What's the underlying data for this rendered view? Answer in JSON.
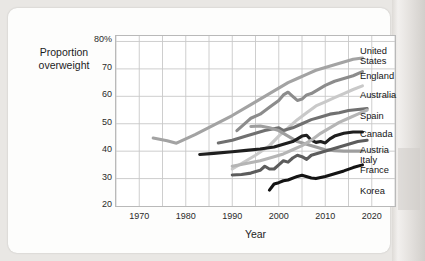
{
  "axes": {
    "y_label_line1": "Proportion",
    "y_label_line2": "overweight",
    "x_label": "Year",
    "y_ticks": [
      "80%",
      "70",
      "60",
      "50",
      "40",
      "30",
      "20"
    ],
    "x_ticks": [
      "1970",
      "1980",
      "1990",
      "2000",
      "2010",
      "2020"
    ]
  },
  "legend": {
    "items": [
      {
        "label_line1": "United",
        "label_line2": "States"
      },
      {
        "label_line1": "England",
        "label_line2": ""
      },
      {
        "label_line1": "Australia",
        "label_line2": ""
      },
      {
        "label_line1": "Spain",
        "label_line2": ""
      },
      {
        "label_line1": "Canada",
        "label_line2": ""
      },
      {
        "label_line1": "Austria",
        "label_line2": ""
      },
      {
        "label_line1": "Italy",
        "label_line2": ""
      },
      {
        "label_line1": "France",
        "label_line2": ""
      },
      {
        "label_line1": "Korea",
        "label_line2": ""
      }
    ]
  },
  "chart_data": {
    "type": "line",
    "title": "",
    "xlabel": "Year",
    "ylabel": "Proportion overweight",
    "xlim": [
      1965,
      2025
    ],
    "ylim": [
      20,
      82
    ],
    "y_unit": "%",
    "grid": true,
    "grid_x_step": 5,
    "grid_y_step": 10,
    "legend_position": "right",
    "series": [
      {
        "name": "United States",
        "color": "#a3a3a3",
        "points": [
          [
            1973,
            44.8
          ],
          [
            1976,
            43.8
          ],
          [
            1978,
            42.9
          ],
          [
            1982,
            46.0
          ],
          [
            1986,
            49.5
          ],
          [
            1990,
            53.0
          ],
          [
            1994,
            57.0
          ],
          [
            1998,
            61.0
          ],
          [
            2000,
            63.0
          ],
          [
            2002,
            65.0
          ],
          [
            2004,
            66.5
          ],
          [
            2006,
            68.0
          ],
          [
            2008,
            69.5
          ],
          [
            2010,
            70.5
          ],
          [
            2012,
            71.5
          ],
          [
            2014,
            72.5
          ],
          [
            2016,
            73.5
          ],
          [
            2018,
            74.0
          ]
        ]
      },
      {
        "name": "England",
        "color": "#8c8c8c",
        "points": [
          [
            1991,
            47.5
          ],
          [
            1993,
            50.5
          ],
          [
            1994,
            52.0
          ],
          [
            1996,
            53.5
          ],
          [
            1998,
            56.0
          ],
          [
            2000,
            58.5
          ],
          [
            2001,
            60.5
          ],
          [
            2002,
            61.5
          ],
          [
            2003,
            60.0
          ],
          [
            2004,
            58.5
          ],
          [
            2005,
            59.0
          ],
          [
            2006,
            60.5
          ],
          [
            2007,
            61.0
          ],
          [
            2008,
            62.0
          ],
          [
            2009,
            63.0
          ],
          [
            2010,
            64.0
          ],
          [
            2012,
            65.5
          ],
          [
            2014,
            66.5
          ],
          [
            2016,
            67.5
          ],
          [
            2018,
            69.0
          ]
        ]
      },
      {
        "name": "Australia",
        "color": "#c9c9c9",
        "points": [
          [
            1990,
            33.5
          ],
          [
            1992,
            35.5
          ],
          [
            1995,
            38.5
          ],
          [
            1998,
            42.0
          ],
          [
            2000,
            45.5
          ],
          [
            2002,
            48.5
          ],
          [
            2004,
            51.5
          ],
          [
            2006,
            54.0
          ],
          [
            2008,
            56.5
          ],
          [
            2010,
            58.0
          ],
          [
            2012,
            59.5
          ],
          [
            2014,
            61.0
          ],
          [
            2016,
            62.5
          ],
          [
            2018,
            63.8
          ]
        ]
      },
      {
        "name": "Spain",
        "color": "#707070",
        "points": [
          [
            1987,
            43.0
          ],
          [
            1990,
            44.0
          ],
          [
            1993,
            45.5
          ],
          [
            1995,
            46.5
          ],
          [
            1997,
            47.5
          ],
          [
            2000,
            48.5
          ],
          [
            2001,
            47.5
          ],
          [
            2003,
            48.5
          ],
          [
            2005,
            50.0
          ],
          [
            2007,
            51.5
          ],
          [
            2009,
            52.5
          ],
          [
            2011,
            53.5
          ],
          [
            2013,
            54.0
          ],
          [
            2015,
            54.8
          ],
          [
            2017,
            55.2
          ],
          [
            2019,
            55.5
          ]
        ]
      },
      {
        "name": "Canada",
        "color": "#9e9e9e",
        "points": [
          [
            1994,
            49.0
          ],
          [
            1996,
            49.2
          ],
          [
            1998,
            48.5
          ],
          [
            2000,
            47.5
          ],
          [
            2002,
            45.5
          ],
          [
            2004,
            43.5
          ],
          [
            2006,
            42.5
          ],
          [
            2008,
            41.5
          ],
          [
            2010,
            40.5
          ],
          [
            2012,
            40.2
          ],
          [
            2014,
            40.0
          ],
          [
            2016,
            40.0
          ],
          [
            2018,
            40.0
          ]
        ]
      },
      {
        "name": "Austria",
        "color": "#1f1f1f",
        "points": [
          [
            1983,
            38.8
          ],
          [
            1986,
            39.2
          ],
          [
            1990,
            39.8
          ],
          [
            1993,
            40.3
          ],
          [
            1996,
            40.8
          ],
          [
            1999,
            41.5
          ],
          [
            2001,
            42.5
          ],
          [
            2003,
            43.5
          ],
          [
            2005,
            45.5
          ],
          [
            2006,
            45.8
          ],
          [
            2007,
            44.0
          ],
          [
            2008,
            43.2
          ],
          [
            2009,
            43.5
          ],
          [
            2010,
            43.0
          ],
          [
            2011,
            44.5
          ],
          [
            2012,
            45.5
          ],
          [
            2014,
            46.5
          ],
          [
            2016,
            47.0
          ],
          [
            2018,
            47.0
          ]
        ]
      },
      {
        "name": "Italy",
        "color": "#5c5c5c",
        "points": [
          [
            1990,
            31.3
          ],
          [
            1992,
            31.5
          ],
          [
            1994,
            32.0
          ],
          [
            1996,
            33.0
          ],
          [
            1997,
            34.5
          ],
          [
            1998,
            33.5
          ],
          [
            1999,
            33.5
          ],
          [
            2000,
            35.0
          ],
          [
            2001,
            36.5
          ],
          [
            2002,
            36.0
          ],
          [
            2003,
            37.5
          ],
          [
            2004,
            38.5
          ],
          [
            2005,
            38.0
          ],
          [
            2006,
            37.0
          ],
          [
            2007,
            38.5
          ],
          [
            2009,
            39.5
          ],
          [
            2011,
            40.5
          ],
          [
            2013,
            41.5
          ],
          [
            2015,
            42.5
          ],
          [
            2017,
            43.5
          ],
          [
            2019,
            44.0
          ]
        ]
      },
      {
        "name": "France",
        "color": "#b5b5b5",
        "points": [
          [
            1990,
            34.5
          ],
          [
            1993,
            35.5
          ],
          [
            1996,
            36.5
          ],
          [
            1999,
            38.0
          ],
          [
            2001,
            39.0
          ],
          [
            2003,
            40.5
          ],
          [
            2005,
            42.0
          ],
          [
            2007,
            44.0
          ],
          [
            2009,
            46.5
          ],
          [
            2011,
            48.5
          ],
          [
            2013,
            50.5
          ],
          [
            2015,
            52.0
          ],
          [
            2017,
            53.5
          ],
          [
            2019,
            55.0
          ]
        ]
      },
      {
        "name": "Korea",
        "color": "#131313",
        "points": [
          [
            1998,
            25.8
          ],
          [
            1999,
            28.0
          ],
          [
            2000,
            28.5
          ],
          [
            2001,
            29.2
          ],
          [
            2002,
            29.5
          ],
          [
            2004,
            30.8
          ],
          [
            2005,
            31.2
          ],
          [
            2007,
            30.2
          ],
          [
            2008,
            30.0
          ],
          [
            2010,
            30.8
          ],
          [
            2012,
            31.8
          ],
          [
            2014,
            32.8
          ],
          [
            2016,
            34.0
          ],
          [
            2018,
            35.0
          ]
        ]
      }
    ]
  }
}
